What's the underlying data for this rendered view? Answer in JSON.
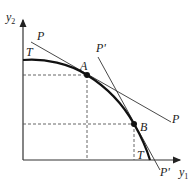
{
  "diagram": {
    "type": "production possibility frontier with price lines",
    "axes": {
      "x_label": "y",
      "x_sub": "1",
      "y_label": "y",
      "y_sub": "2"
    },
    "curve": {
      "label_top": "T",
      "label_bottom": "T"
    },
    "lines": [
      {
        "id": "P",
        "label_top": "P",
        "label_bottom": "P",
        "tangent_at": "A"
      },
      {
        "id": "P'",
        "label_top": "P'",
        "label_bottom": "P'",
        "tangent_at": "B"
      }
    ],
    "points": [
      {
        "id": "A",
        "label": "A"
      },
      {
        "id": "B",
        "label": "B"
      }
    ],
    "colors": {
      "stroke": "#222222",
      "dashed": "#555555"
    }
  }
}
